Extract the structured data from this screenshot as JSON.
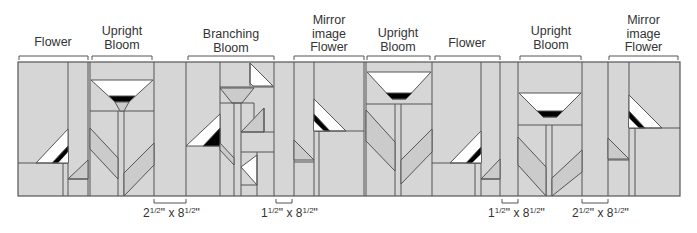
{
  "colors": {
    "fabric_gray": "#d6d6d6",
    "fabric_mid": "#cbcbcb",
    "line": "#555555",
    "black": "#000000",
    "white": "#ffffff"
  },
  "blocks": [
    {
      "label_lines": [
        "Flower"
      ],
      "x1": 18,
      "x2": 88
    },
    {
      "label_lines": [
        "Upright",
        "Bloom"
      ],
      "x1": 92,
      "x2": 152
    },
    {
      "label_lines": [
        "Branching",
        "Bloom"
      ],
      "x1": 188,
      "x2": 274
    },
    {
      "label_lines": [
        "Mirror",
        "image",
        "Flower"
      ],
      "x1": 294,
      "x2": 364
    },
    {
      "label_lines": [
        "Upright",
        "Bloom"
      ],
      "x1": 366,
      "x2": 430
    },
    {
      "label_lines": [
        "Flower"
      ],
      "x1": 434,
      "x2": 500
    },
    {
      "label_lines": [
        "Upright",
        "Bloom"
      ],
      "x1": 520,
      "x2": 581
    },
    {
      "label_lines": [
        "Mirror",
        "image",
        "Flower"
      ],
      "x1": 609,
      "x2": 678
    }
  ],
  "labels": {
    "b0": "Flower",
    "b1a": "Upright",
    "b1b": "Bloom",
    "b2a": "Branching",
    "b2b": "Bloom",
    "b3a": "Mirror",
    "b3b": "image",
    "b3c": "Flower",
    "b4a": "Upright",
    "b4b": "Bloom",
    "b5": "Flower",
    "b6a": "Upright",
    "b6b": "Bloom",
    "b7a": "Mirror",
    "b7b": "image",
    "b7c": "Flower"
  },
  "spacers": [
    {
      "whole_w": "2",
      "frac_w": "1/2",
      "whole_h": "8",
      "frac_h": "1/2",
      "x1": 154,
      "x2": 186
    },
    {
      "whole_w": "1",
      "frac_w": "1/2",
      "whole_h": "8",
      "frac_h": "1/2",
      "x1": 276,
      "x2": 292
    },
    {
      "whole_w": "1",
      "frac_w": "1/2",
      "whole_h": "8",
      "frac_h": "1/2",
      "x1": 502,
      "x2": 518
    },
    {
      "whole_w": "2",
      "frac_w": "1/2",
      "whole_h": "8",
      "frac_h": "1/2",
      "x1": 582,
      "x2": 608
    }
  ],
  "dimension_sep": "x",
  "inch_mark": "\""
}
